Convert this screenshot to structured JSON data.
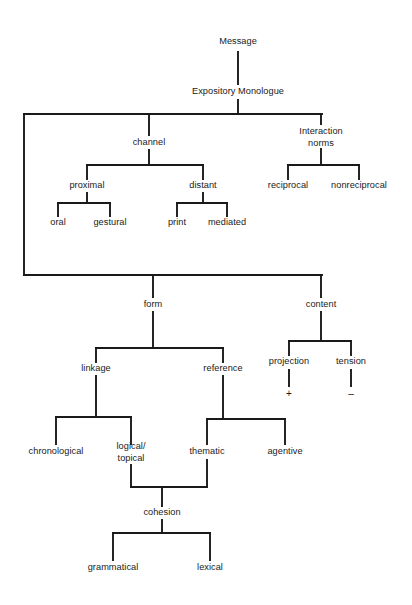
{
  "diagram": {
    "type": "hierarchy-tree",
    "line_color": "#1a1a1a",
    "text_color": "#1a1a1a",
    "background": "#ffffff",
    "nodes": [
      {
        "id": "message",
        "label": "Message",
        "x": 238,
        "y": 42
      },
      {
        "id": "expository",
        "label": "Expository Monologue",
        "x": 238,
        "y": 92
      },
      {
        "id": "channel",
        "label": "channel",
        "x": 149,
        "y": 143
      },
      {
        "id": "interaction",
        "label": "Interaction\nnorms",
        "x": 321,
        "y": 137
      },
      {
        "id": "proximal",
        "label": "proximal",
        "x": 87,
        "y": 186
      },
      {
        "id": "distant",
        "label": "distant",
        "x": 203,
        "y": 186
      },
      {
        "id": "reciprocal",
        "label": "reciprocal",
        "x": 288,
        "y": 186
      },
      {
        "id": "nonreciprocal",
        "label": "nonreciprocal",
        "x": 359,
        "y": 186
      },
      {
        "id": "oral",
        "label": "oral",
        "x": 58,
        "y": 223
      },
      {
        "id": "gestural",
        "label": "gestural",
        "x": 110,
        "y": 223
      },
      {
        "id": "print",
        "label": "print",
        "x": 177,
        "y": 223
      },
      {
        "id": "mediated",
        "label": "mediated",
        "x": 227,
        "y": 223
      },
      {
        "id": "form",
        "label": "form",
        "x": 153,
        "y": 305
      },
      {
        "id": "content",
        "label": "content",
        "x": 321,
        "y": 305
      },
      {
        "id": "linkage",
        "label": "linkage",
        "x": 96,
        "y": 369
      },
      {
        "id": "reference",
        "label": "reference",
        "x": 223,
        "y": 369
      },
      {
        "id": "projection",
        "label": "projection",
        "x": 289,
        "y": 362
      },
      {
        "id": "tension",
        "label": "tension",
        "x": 351,
        "y": 362
      },
      {
        "id": "plus",
        "label": "+",
        "x": 289,
        "y": 394,
        "style": "sign"
      },
      {
        "id": "minus",
        "label": "–",
        "x": 351,
        "y": 394,
        "style": "sign"
      },
      {
        "id": "chronological",
        "label": "chronological",
        "x": 56,
        "y": 452
      },
      {
        "id": "logical_topical",
        "label": "logical/\ntopical",
        "x": 131,
        "y": 452
      },
      {
        "id": "thematic",
        "label": "thematic",
        "x": 207,
        "y": 452
      },
      {
        "id": "agentive",
        "label": "agentive",
        "x": 285,
        "y": 452
      },
      {
        "id": "cohesion",
        "label": "cohesion",
        "x": 162,
        "y": 513
      },
      {
        "id": "grammatical",
        "label": "grammatical",
        "x": 113,
        "y": 568
      },
      {
        "id": "lexical",
        "label": "lexical",
        "x": 210,
        "y": 568
      }
    ],
    "edges": [
      {
        "from": "message",
        "to": "expository",
        "kind": "vertical",
        "x": 238,
        "y1": 52,
        "y2": 84
      },
      {
        "from": "expository",
        "to": "level2-bus",
        "kind": "vertical",
        "x": 238,
        "y1": 100,
        "y2": 114
      },
      {
        "from": "level2-bus",
        "to": "children",
        "kind": "horizontal",
        "y": 114,
        "x1": 24,
        "x2": 322
      },
      {
        "from": "level2-bus",
        "to": "channel",
        "kind": "vertical",
        "x": 149,
        "y1": 114,
        "y2": 135
      },
      {
        "from": "level2-bus",
        "to": "interaction",
        "kind": "vertical",
        "x": 321,
        "y1": 114,
        "y2": 124
      },
      {
        "from": "level2-bus",
        "to": "form-bus",
        "kind": "vertical",
        "x": 24,
        "y1": 114,
        "y2": 275
      },
      {
        "from": "channel",
        "to": "channel-bus",
        "kind": "vertical",
        "x": 149,
        "y1": 150,
        "y2": 165
      },
      {
        "from": "channel-bus",
        "to": "children",
        "kind": "horizontal",
        "y": 165,
        "x1": 87,
        "x2": 203
      },
      {
        "from": "channel-bus",
        "to": "proximal",
        "kind": "vertical",
        "x": 87,
        "y1": 165,
        "y2": 179
      },
      {
        "from": "channel-bus",
        "to": "distant",
        "kind": "vertical",
        "x": 203,
        "y1": 165,
        "y2": 179
      },
      {
        "from": "interaction",
        "to": "inter-bus",
        "kind": "vertical",
        "x": 321,
        "y1": 149,
        "y2": 165
      },
      {
        "from": "inter-bus",
        "to": "children",
        "kind": "horizontal",
        "y": 165,
        "x1": 288,
        "x2": 359
      },
      {
        "from": "inter-bus",
        "to": "reciprocal",
        "kind": "vertical",
        "x": 288,
        "y1": 165,
        "y2": 179
      },
      {
        "from": "inter-bus",
        "to": "nonreciprocal",
        "kind": "vertical",
        "x": 359,
        "y1": 165,
        "y2": 179
      },
      {
        "from": "proximal",
        "to": "prox-bus",
        "kind": "vertical",
        "x": 87,
        "y1": 193,
        "y2": 203
      },
      {
        "from": "prox-bus",
        "to": "children",
        "kind": "horizontal",
        "y": 203,
        "x1": 58,
        "x2": 110
      },
      {
        "from": "prox-bus",
        "to": "oral",
        "kind": "vertical",
        "x": 58,
        "y1": 203,
        "y2": 216
      },
      {
        "from": "prox-bus",
        "to": "gestural",
        "kind": "vertical",
        "x": 110,
        "y1": 203,
        "y2": 216
      },
      {
        "from": "distant",
        "to": "dist-bus",
        "kind": "vertical",
        "x": 203,
        "y1": 193,
        "y2": 203
      },
      {
        "from": "dist-bus",
        "to": "children",
        "kind": "horizontal",
        "y": 203,
        "x1": 177,
        "x2": 227
      },
      {
        "from": "dist-bus",
        "to": "print",
        "kind": "vertical",
        "x": 177,
        "y1": 203,
        "y2": 216
      },
      {
        "from": "dist-bus",
        "to": "mediated",
        "kind": "vertical",
        "x": 227,
        "y1": 203,
        "y2": 216
      },
      {
        "from": "form-bus",
        "to": "children",
        "kind": "horizontal",
        "y": 275,
        "x1": 24,
        "x2": 322
      },
      {
        "from": "form-bus",
        "to": "form",
        "kind": "vertical",
        "x": 153,
        "y1": 275,
        "y2": 297
      },
      {
        "from": "form-bus",
        "to": "content",
        "kind": "vertical",
        "x": 321,
        "y1": 275,
        "y2": 297
      },
      {
        "from": "form",
        "to": "fchild-bus",
        "kind": "vertical",
        "x": 153,
        "y1": 312,
        "y2": 348
      },
      {
        "from": "fchild-bus",
        "to": "children",
        "kind": "horizontal",
        "y": 348,
        "x1": 96,
        "x2": 223
      },
      {
        "from": "fchild-bus",
        "to": "linkage",
        "kind": "vertical",
        "x": 96,
        "y1": 348,
        "y2": 362
      },
      {
        "from": "fchild-bus",
        "to": "reference",
        "kind": "vertical",
        "x": 223,
        "y1": 348,
        "y2": 362
      },
      {
        "from": "content",
        "to": "cchild-bus",
        "kind": "vertical",
        "x": 321,
        "y1": 312,
        "y2": 341
      },
      {
        "from": "cchild-bus",
        "to": "children",
        "kind": "horizontal",
        "y": 341,
        "x1": 289,
        "x2": 351
      },
      {
        "from": "cchild-bus",
        "to": "projection",
        "kind": "vertical",
        "x": 289,
        "y1": 341,
        "y2": 355
      },
      {
        "from": "cchild-bus",
        "to": "tension",
        "kind": "vertical",
        "x": 351,
        "y1": 341,
        "y2": 355
      },
      {
        "from": "projection",
        "to": "plus",
        "kind": "vertical",
        "x": 289,
        "y1": 370,
        "y2": 386
      },
      {
        "from": "tension",
        "to": "minus",
        "kind": "vertical",
        "x": 351,
        "y1": 370,
        "y2": 386
      },
      {
        "from": "linkage",
        "to": "link-bus",
        "kind": "vertical",
        "x": 96,
        "y1": 376,
        "y2": 417
      },
      {
        "from": "link-bus",
        "to": "children",
        "kind": "horizontal",
        "y": 417,
        "x1": 56,
        "x2": 131
      },
      {
        "from": "link-bus",
        "to": "chronological",
        "kind": "vertical",
        "x": 56,
        "y1": 417,
        "y2": 444
      },
      {
        "from": "link-bus",
        "to": "logical_topical",
        "kind": "vertical",
        "x": 131,
        "y1": 417,
        "y2": 444
      },
      {
        "from": "reference",
        "to": "ref-bus",
        "kind": "vertical",
        "x": 223,
        "y1": 376,
        "y2": 419
      },
      {
        "from": "ref-bus",
        "to": "children",
        "kind": "horizontal",
        "y": 419,
        "x1": 207,
        "x2": 285
      },
      {
        "from": "ref-bus",
        "to": "thematic",
        "kind": "vertical",
        "x": 207,
        "y1": 419,
        "y2": 444
      },
      {
        "from": "ref-bus",
        "to": "agentive",
        "kind": "vertical",
        "x": 285,
        "y1": 419,
        "y2": 444
      },
      {
        "from": "logical_topical",
        "to": "coh-bus",
        "kind": "vertical",
        "x": 131,
        "y1": 465,
        "y2": 487
      },
      {
        "from": "thematic",
        "to": "coh-bus",
        "kind": "vertical",
        "x": 207,
        "y1": 460,
        "y2": 487
      },
      {
        "from": "coh-bus",
        "to": "cohesion",
        "kind": "horizontal",
        "y": 487,
        "x1": 131,
        "x2": 207
      },
      {
        "from": "coh-bus",
        "to": "cohesion",
        "kind": "vertical",
        "x": 162,
        "y1": 487,
        "y2": 506
      },
      {
        "from": "cohesion",
        "to": "cohchild-bus",
        "kind": "vertical",
        "x": 162,
        "y1": 520,
        "y2": 533
      },
      {
        "from": "cohchild-bus",
        "to": "children",
        "kind": "horizontal",
        "y": 533,
        "x1": 113,
        "x2": 210
      },
      {
        "from": "cohchild-bus",
        "to": "grammatical",
        "kind": "vertical",
        "x": 113,
        "y1": 533,
        "y2": 560
      },
      {
        "from": "cohchild-bus",
        "to": "lexical",
        "kind": "vertical",
        "x": 210,
        "y1": 533,
        "y2": 560
      }
    ]
  }
}
